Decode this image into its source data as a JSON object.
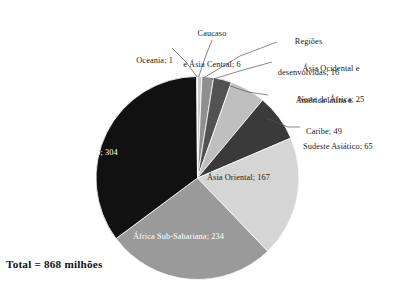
{
  "chart_data": {
    "type": "pie",
    "title": "",
    "subtitle": "",
    "xlabel": "",
    "ylabel": "",
    "legend_position": "none",
    "grid": false,
    "units": "milhões",
    "total": 868,
    "total_label": "Total = 868 milhões",
    "start_angle_deg": 0,
    "direction": "clockwise",
    "categories": [
      "Caucaso e Ásia Central",
      "Regiões desenvolvidas",
      "Ásia Ocidental e Norte da África",
      "América latina e Caribe",
      "Sudeste Asiático",
      "Ásia Oriental",
      "África Sub-Sahariana",
      "Sul Asiático",
      "Oceania"
    ],
    "values": [
      6,
      16,
      25,
      49,
      65,
      167,
      234,
      304,
      1
    ],
    "colors": [
      "#c9c9c9",
      "#8f8f8f",
      "#525252",
      "#bfbfbf",
      "#3a3a3a",
      "#d5d5d5",
      "#9a9a9a",
      "#111111",
      "#e8e8e8"
    ],
    "slices": [
      {
        "name": "Caucaso e Ásia Central",
        "value": 6,
        "label": "Caucaso\ne Ásia Central; 6",
        "label_line1": "Caucaso",
        "label_line2": "e Ásia Central; 6",
        "color": "#c9c9c9",
        "label_placement": "outside",
        "text_color": "#1a1a1a"
      },
      {
        "name": "Regiões desenvolvidas",
        "value": 16,
        "label": "Regiões\ndesenvolvidas; 16",
        "label_line1": "Regiões",
        "label_line2": "desenvolvidas; 16",
        "color": "#8f8f8f",
        "label_placement": "outside",
        "text_color": "#1a1a1a"
      },
      {
        "name": "Ásia Ocidental e Norte da África",
        "value": 25,
        "label": "Ásia Ocidental e\nNorte da África; 25",
        "label_line1": "Ásia Ocidental e",
        "label_line2": "Norte da África; 25",
        "color": "#525252",
        "label_placement": "outside",
        "text_color": "#1a1a1a"
      },
      {
        "name": "América latina e Caribe",
        "value": 49,
        "label": "América latina e\nCaribe; 49",
        "label_line1": "América latina e",
        "label_line2": "Caribe; 49",
        "color": "#bfbfbf",
        "label_placement": "outside",
        "text_color": "#1a1a1a"
      },
      {
        "name": "Sudeste Asiático",
        "value": 65,
        "label": "Sudeste Asiático; 65",
        "label_line1": "Sudeste Asiático; 65",
        "label_line2": "",
        "color": "#3a3a3a",
        "label_placement": "outside",
        "text_color": "#1a1a1a"
      },
      {
        "name": "Ásia Oriental",
        "value": 167,
        "label": "Ásia Oriental; 167",
        "label_line1": "Ásia Oriental; 167",
        "label_line2": "",
        "color": "#d5d5d5",
        "label_placement": "inside",
        "text_color": "#1a1a1a"
      },
      {
        "name": "África Sub-Sahariana",
        "value": 234,
        "label": "África Sub-Sahariana; 234",
        "label_line1": "África Sub-Sahariana; 234",
        "label_line2": "",
        "color": "#9a9a9a",
        "label_placement": "inside",
        "text_color": "#ffffff"
      },
      {
        "name": "Sul Asiático",
        "value": 304,
        "label": "Sul Asiático; 304",
        "label_line1": "Sul Asiático; 304",
        "label_line2": "",
        "color": "#111111",
        "label_placement": "inside",
        "text_color": "#ffffff"
      },
      {
        "name": "Oceania",
        "value": 1,
        "label": "Oceania; 1",
        "label_line1": "Oceania; 1",
        "label_line2": "",
        "color": "#e8e8e8",
        "label_placement": "outside",
        "text_color": "#1a1a1a"
      }
    ]
  },
  "labels": {
    "oceania_line1": "Oceania; 1",
    "caucaso_line1": "Caucaso",
    "caucaso_line2": "e Ásia Central; 6",
    "regioes_line1": "Regiões",
    "regioes_line2": "desenvolvidas; 16",
    "asia_ocidental_line1": "Ásia Ocidental e",
    "asia_ocidental_line2": "Norte da África; 25",
    "america_latina_line1": "América latina e",
    "america_latina_line2": "Caribe; 49",
    "sudeste_line1": "Sudeste Asiático; 65",
    "asia_oriental": "Ásia Oriental; 167",
    "africa_sub": "África Sub-Sahariana; 234",
    "sul_asiatico": "Sul Asiático; 304",
    "total": "Total = 868 milhões"
  }
}
